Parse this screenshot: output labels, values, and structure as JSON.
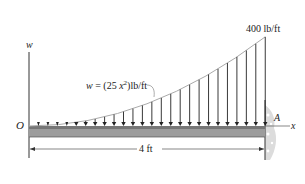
{
  "diagram": {
    "axis_y_label": "w",
    "axis_x_label": "x",
    "origin_label": "O",
    "support_label": "A",
    "peak_load_label": "400 lb/ft",
    "load_function_label": "w = (25 x²)lb/ft",
    "load_function_parts": {
      "w": "w",
      "eq": " = (25 ",
      "x": "x",
      "sup": "2",
      "unit": ")lb/ft"
    },
    "dimension_label": "4 ft",
    "colors": {
      "beam_fill": "#9a9a9a",
      "beam_top": "#6e6e6e",
      "line": "#222222",
      "wall": "#d8d8d8"
    }
  }
}
